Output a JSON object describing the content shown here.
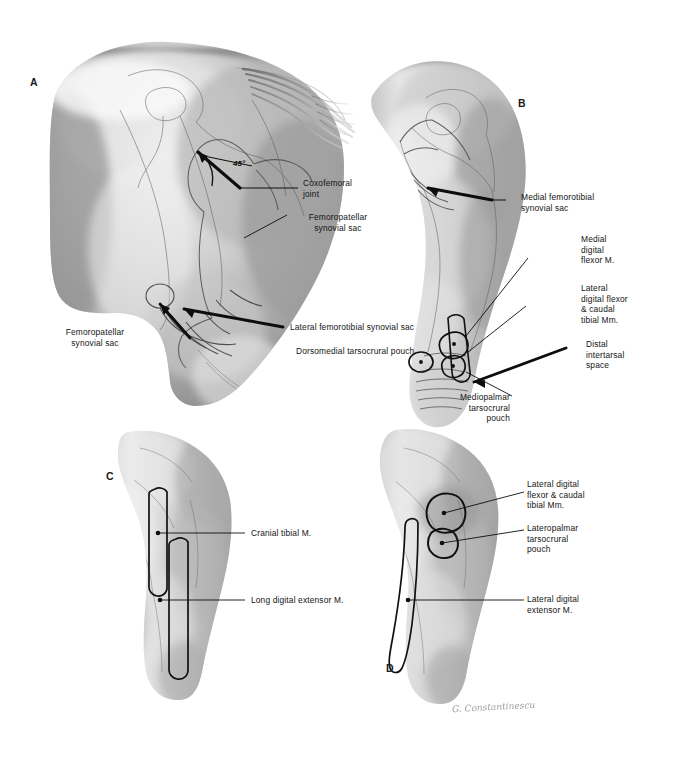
{
  "figure": {
    "background_color": "#ffffff",
    "ink_color": "#111111",
    "signature": "G. Constantinescu"
  },
  "panels": [
    {
      "id": "A",
      "letter": "A",
      "name": "panel-a-lateral-hindquarter"
    },
    {
      "id": "B",
      "letter": "B",
      "name": "panel-b-medial-hindlimb"
    },
    {
      "id": "C",
      "letter": "C",
      "name": "panel-c-cranial-crus"
    },
    {
      "id": "D",
      "letter": "D",
      "name": "panel-d-lateral-crus"
    }
  ],
  "annotations": {
    "angle": "45°"
  },
  "labels": {
    "panel_a": [
      {
        "id": "coxofemoral-joint",
        "text": "Coxofemoral\njoint",
        "align": "left"
      },
      {
        "id": "femoropatellar-synovial-sac-right",
        "text": "Femoropatellar\nsynovial sac",
        "align": "center"
      },
      {
        "id": "femoropatellar-synovial-sac-left",
        "text": "Femoropatellar\nsynovial sac",
        "align": "center"
      },
      {
        "id": "lateral-femorotibial-synovial-sac",
        "text": "Lateral femorotibial synovial sac",
        "align": "left"
      },
      {
        "id": "dorsomedial-tarsocrural-pouch",
        "text": "Dorsomedial tarsocrural pouch",
        "align": "left"
      }
    ],
    "panel_b": [
      {
        "id": "medial-femorotibial-synovial-sac",
        "text": "Medial femorotibial\nsynovial sac",
        "align": "left"
      },
      {
        "id": "medial-digital-flexor-m",
        "text": "Medial\ndigital\nflexor M.",
        "align": "left"
      },
      {
        "id": "lateral-digital-flexor-caudal-tibial-mm",
        "text": "Lateral\ndigital flexor\n& caudal\ntibial Mm.",
        "align": "left"
      },
      {
        "id": "distal-intertarsal-space",
        "text": "Distal\nintertarsal\nspace",
        "align": "left"
      },
      {
        "id": "mediopalmar-tarsocrural-pouch",
        "text": "Mediopalmar\ntarsocrural\npouch",
        "align": "right"
      }
    ],
    "panel_c": [
      {
        "id": "cranial-tibial-m",
        "text": "Cranial tibial M.",
        "align": "left"
      },
      {
        "id": "long-digital-extensor-m",
        "text": "Long digital extensor M.",
        "align": "left"
      }
    ],
    "panel_d": [
      {
        "id": "lateral-digital-flexor-caudal-tibial-mm-d",
        "text": "Lateral digital\nflexor & caudal\ntibial Mm.",
        "align": "left"
      },
      {
        "id": "lateropalmar-tarsocrural-pouch",
        "text": "Lateropalmar\ntarsocrural\npouch",
        "align": "left"
      },
      {
        "id": "lateral-digital-extensor-m",
        "text": "Lateral digital\nextensor M.",
        "align": "left"
      }
    ]
  }
}
